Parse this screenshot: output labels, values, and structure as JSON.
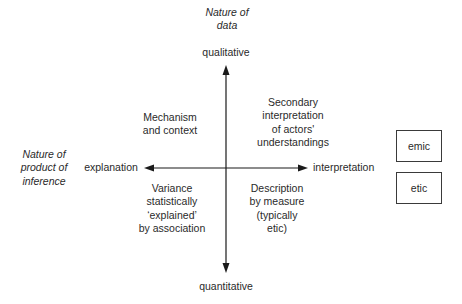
{
  "diagram": {
    "vertical_axis": {
      "title": "Nature of\ndata",
      "top_label": "qualitative",
      "bottom_label": "quantitative"
    },
    "horizontal_axis": {
      "title": "Nature of\nproduct of\ninference",
      "left_label": "explanation",
      "right_label": "interpretation"
    },
    "quadrants": {
      "top_left": "Mechanism\nand context",
      "top_right": "Secondary\ninterpretation\nof actors'\nunderstandings",
      "bottom_left": "Variance\nstatistically\n‘explained’\nby association",
      "bottom_right": "Description\nby measure\n(typically\netic)"
    },
    "legend_boxes": [
      {
        "label": "emic"
      },
      {
        "label": "etic"
      }
    ],
    "colors": {
      "line": "#1a1a1a",
      "text": "#2a2a2a",
      "background": "#ffffff"
    }
  }
}
